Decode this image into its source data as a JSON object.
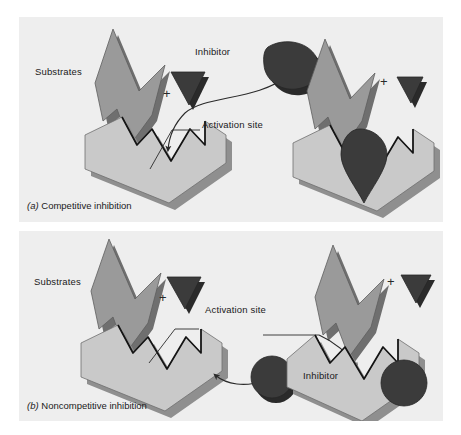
{
  "figure": {
    "background_color": "#ffffff",
    "panel_background": "#eeeeee",
    "colors": {
      "substrate": "#9a9a9a",
      "substrate_shadow": "#6f6f6f",
      "enzyme": "#c9c9c9",
      "enzyme_shadow": "#8f8f8f",
      "inhibitor": "#3b3b3b",
      "inhibitor_shadow": "#2a2a2a",
      "outline": "#1a1a1a",
      "text": "#1a1a1a"
    }
  },
  "panel_a": {
    "caption_letter": "(a)",
    "caption_text": "Competitive inhibition",
    "labels": {
      "substrates": "Substrates",
      "inhibitor": "Inhibitor",
      "activation_site": "Activation site"
    },
    "plus_signs": [
      "+",
      "+"
    ],
    "mechanism": {
      "name": "competitive",
      "inhibitor_shape": "teardrop",
      "substrate_shape": "arrow-chevron",
      "binding_site": "active site",
      "left_state": "substrate and inhibitor unbound, inhibitor approaching active site",
      "right_state": "inhibitor occupies active site, substrate excluded"
    }
  },
  "panel_b": {
    "caption_letter": "(b)",
    "caption_text": "Noncompetitive inhibition",
    "labels": {
      "substrates": "Substrates",
      "inhibitor": "Inhibitor",
      "activation_site": "Activation site"
    },
    "plus_signs": [
      "+",
      "+"
    ],
    "mechanism": {
      "name": "noncompetitive",
      "inhibitor_shape": "circle",
      "substrate_shape": "arrow-chevron",
      "binding_site": "allosteric site",
      "left_state": "inhibitor approaching allosteric site on enzyme flank",
      "right_state": "inhibitor bound at allosteric site, active site distorted"
    }
  }
}
